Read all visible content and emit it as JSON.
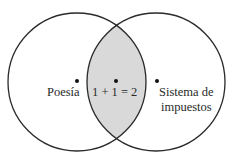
{
  "diagram": {
    "type": "venn",
    "sets": [
      {
        "label": "Poesía",
        "cx": 77,
        "cy": 82,
        "r": 69
      },
      {
        "label_lines": [
          "Sistema de",
          "impuestos"
        ],
        "cx": 156,
        "cy": 82,
        "r": 69
      }
    ],
    "intersection": {
      "label": "1 + 1 = 2",
      "fill": "#d9d9d9"
    },
    "colors": {
      "stroke": "#2a2a2a",
      "background": "#ffffff",
      "dot": "#111111"
    }
  }
}
